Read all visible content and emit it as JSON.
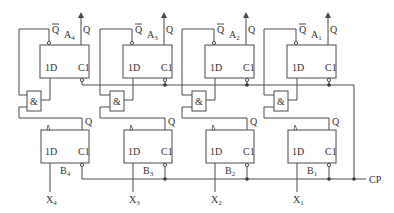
{
  "diagram": {
    "type": "circuit",
    "clock_label": "CP",
    "pin_labels": {
      "data": "1D",
      "clock": "C1",
      "q": "Q",
      "qbar": "Q",
      "and": "&"
    },
    "a_flipflops": [
      {
        "name": "A",
        "sub": "4"
      },
      {
        "name": "A",
        "sub": "3"
      },
      {
        "name": "A",
        "sub": "2"
      },
      {
        "name": "A",
        "sub": "1"
      }
    ],
    "b_flipflops": [
      {
        "name": "B",
        "sub": "4"
      },
      {
        "name": "B",
        "sub": "3"
      },
      {
        "name": "B",
        "sub": "2"
      },
      {
        "name": "B",
        "sub": "1"
      }
    ],
    "inputs": [
      {
        "name": "X",
        "sub": "4"
      },
      {
        "name": "X",
        "sub": "3"
      },
      {
        "name": "X",
        "sub": "2"
      },
      {
        "name": "X",
        "sub": "1"
      }
    ]
  }
}
